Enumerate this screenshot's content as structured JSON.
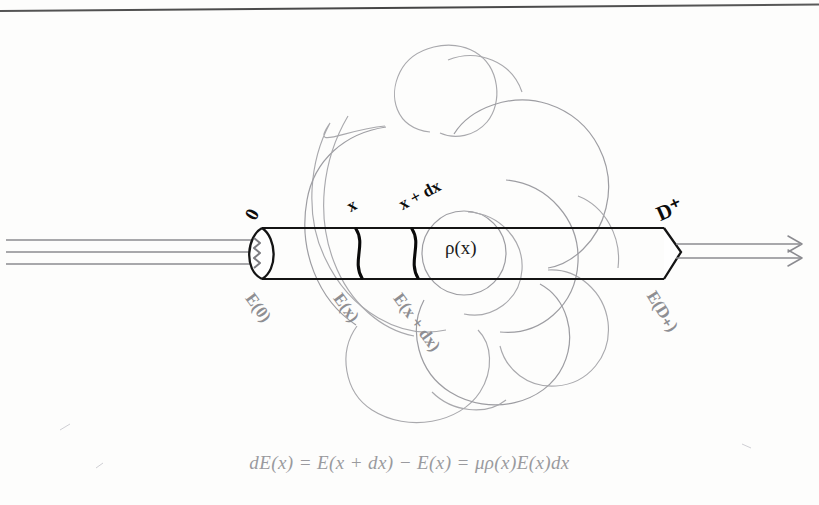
{
  "page": {
    "background_color": "#fdfdfc",
    "ink_color": "#111111",
    "faint_ink_color": "#9a9a9e",
    "has_top_rule": true
  },
  "figure": {
    "name": "beam-attenuation-cylinder-diagram",
    "cylinder": {
      "left_face_label": "0",
      "right_face_label": "D⁺",
      "slice_labels": [
        "x",
        "x + dx"
      ],
      "density_label": "ρ(x)"
    },
    "field_labels": [
      {
        "id": "e-zero",
        "text": "E(0)"
      },
      {
        "id": "e-x",
        "text": "E(x)"
      },
      {
        "id": "e-x-plus-dx",
        "text": "E(x + dx)"
      },
      {
        "id": "e-d-plus",
        "text": "E(D₊)"
      }
    ],
    "beam_in_rays": 3,
    "beam_out_rays": 2
  },
  "formula": {
    "id": "attenuation-equation",
    "full_text": "dE(x) = E(x + dx) − E(x) = μρ(x)E(x)dx",
    "parts": {
      "lhs": "dE(x)",
      "eq1": "=",
      "mid1": "E(x + dx)",
      "minus": "−",
      "mid2": "E(x)",
      "eq2": "=",
      "rhs": "μρ(x)E(x)dx"
    }
  },
  "icons": {
    "arrow_right": "arrow-right-icon",
    "squiggle": "squiggle-icon"
  }
}
